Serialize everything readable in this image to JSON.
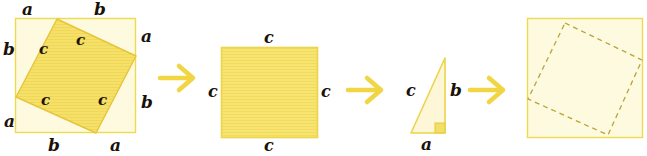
{
  "figure": {
    "panel_count": 4,
    "colors": {
      "fill": "#f5e06a",
      "outer_fill": "#fdfae0",
      "stroke": "#e8c93c",
      "arrow": "#f2d543",
      "dashed": "#b9a43a",
      "label": "#1a1208"
    }
  },
  "panel1": {
    "name": "tilted-square-in-outer-square",
    "outer_top_left_label": "a",
    "outer_top_right_label": "b",
    "outer_right_top_label": "a",
    "outer_right_bottom_label": "b",
    "outer_bottom_left_label": "b",
    "outer_bottom_right_label": "a",
    "outer_left_top_label": "b",
    "outer_left_bottom_label": "a",
    "inner_labels": [
      "c",
      "c",
      "c",
      "c"
    ],
    "inner_label_top_left": "c",
    "inner_label_top_right": "c",
    "inner_label_bottom_left": "c",
    "inner_label_bottom_right": "c"
  },
  "arrow1": {
    "name": "arrow-right",
    "glyph": "arrow"
  },
  "panel2": {
    "name": "square-c",
    "label_top": "c",
    "label_right": "c",
    "label_bottom": "c",
    "label_left": "c"
  },
  "arrow2": {
    "name": "arrow-right",
    "glyph": "arrow"
  },
  "panel3": {
    "name": "right-triangle",
    "label_hypotenuse": "c",
    "label_vertical_leg": "b",
    "label_horizontal_leg": "a",
    "right_angle_marker": true
  },
  "arrow3": {
    "name": "arrow-right",
    "glyph": "arrow"
  },
  "panel4": {
    "name": "outer-square-with-dashed-tilted-square",
    "dashed": true
  }
}
